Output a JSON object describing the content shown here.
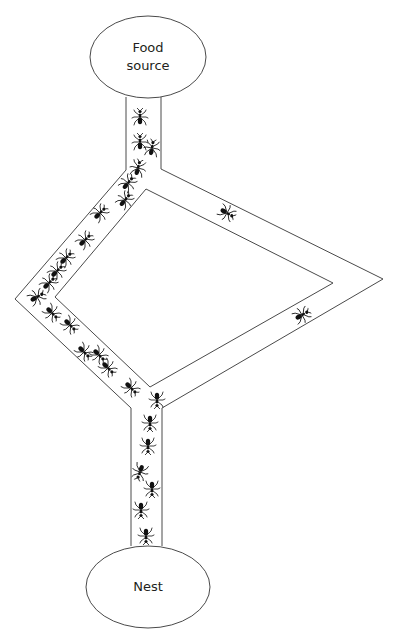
{
  "diagram": {
    "colors": {
      "stroke": "#4a4a4a",
      "ant": "#111111",
      "text": "#231f20",
      "background": "#ffffff"
    },
    "nodes": {
      "food": {
        "label_line1": "Food",
        "label_line2": "source",
        "cx": 148,
        "cy": 57,
        "rx": 58,
        "ry": 41
      },
      "nest": {
        "label": "Nest",
        "cx": 148,
        "cy": 587,
        "rx": 62,
        "ry": 41
      }
    },
    "paths": {
      "short_path": "left branch (shorter) — crowded with ants",
      "long_path": "right branch (longer) — few ants"
    },
    "ants": [
      {
        "x": 140,
        "y": 117,
        "r": 0
      },
      {
        "x": 140,
        "y": 142,
        "r": 0
      },
      {
        "x": 152,
        "y": 148,
        "r": 10
      },
      {
        "x": 138,
        "y": 168,
        "r": 15
      },
      {
        "x": 128,
        "y": 183,
        "r": 40
      },
      {
        "x": 125,
        "y": 200,
        "r": 40
      },
      {
        "x": 100,
        "y": 213,
        "r": 45
      },
      {
        "x": 85,
        "y": 240,
        "r": 45
      },
      {
        "x": 66,
        "y": 258,
        "r": 45
      },
      {
        "x": 57,
        "y": 271,
        "r": 45
      },
      {
        "x": 49,
        "y": 283,
        "r": 45
      },
      {
        "x": 37,
        "y": 297,
        "r": 60
      },
      {
        "x": 52,
        "y": 313,
        "r": 135
      },
      {
        "x": 70,
        "y": 325,
        "r": 135
      },
      {
        "x": 84,
        "y": 352,
        "r": 135
      },
      {
        "x": 99,
        "y": 355,
        "r": 135
      },
      {
        "x": 108,
        "y": 368,
        "r": 135
      },
      {
        "x": 131,
        "y": 388,
        "r": 135
      },
      {
        "x": 157,
        "y": 400,
        "r": 180
      },
      {
        "x": 150,
        "y": 423,
        "r": 180
      },
      {
        "x": 148,
        "y": 446,
        "r": 180
      },
      {
        "x": 140,
        "y": 472,
        "r": 200
      },
      {
        "x": 152,
        "y": 489,
        "r": 180
      },
      {
        "x": 141,
        "y": 510,
        "r": 180
      },
      {
        "x": 146,
        "y": 536,
        "r": 180
      },
      {
        "x": 227,
        "y": 213,
        "r": 120
      },
      {
        "x": 302,
        "y": 315,
        "r": 60
      }
    ]
  }
}
